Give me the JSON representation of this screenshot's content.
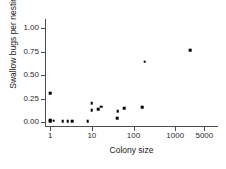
{
  "chart_data": {
    "type": "scatter",
    "title": "",
    "xlabel": "Colony size",
    "ylabel": "Swallow bugs per nesting",
    "xscale": "log",
    "yscale": "linear",
    "xlim": [
      0.75,
      9000
    ],
    "ylim": [
      -0.04,
      1.1
    ],
    "grid": false,
    "legend": null,
    "xticks": [
      1,
      10,
      100,
      1000,
      5000
    ],
    "xtick_labels": [
      "1",
      "10",
      "100",
      "1000",
      "5000"
    ],
    "yticks": [
      0.0,
      0.25,
      0.5,
      0.75,
      1.0
    ],
    "ytick_labels": [
      "0.00",
      "0.25",
      "0.50",
      "0.75",
      "1.00"
    ],
    "marker": "filled-square",
    "marker_color": "#000000",
    "points": [
      {
        "x": 1,
        "y": 0.3
      },
      {
        "x": 1,
        "y": 0.01
      },
      {
        "x": 1,
        "y": 0.0
      },
      {
        "x": 1.2,
        "y": 0.005
      },
      {
        "x": 2,
        "y": 0.0
      },
      {
        "x": 2.6,
        "y": 0.0
      },
      {
        "x": 3.4,
        "y": 0.0
      },
      {
        "x": 8,
        "y": 0.0
      },
      {
        "x": 10,
        "y": 0.19
      },
      {
        "x": 10,
        "y": 0.115
      },
      {
        "x": 14,
        "y": 0.13
      },
      {
        "x": 17,
        "y": 0.155
      },
      {
        "x": 40,
        "y": 0.035
      },
      {
        "x": 42,
        "y": 0.105
      },
      {
        "x": 60,
        "y": 0.14
      },
      {
        "x": 160,
        "y": 0.15
      },
      {
        "x": 185,
        "y": 0.635
      },
      {
        "x": 2300,
        "y": 0.755
      }
    ]
  },
  "axes": {
    "y_title": "Swallow bugs per nesting",
    "x_title": "Colony size"
  }
}
